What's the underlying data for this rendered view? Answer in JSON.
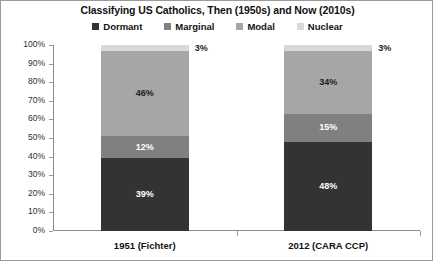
{
  "chart_data": {
    "type": "bar",
    "subtype": "stacked-column-100",
    "title": "Classifying US Catholics, Then (1950s) and Now (2010s)",
    "xlabel": "",
    "ylabel": "",
    "ylim": [
      0,
      100
    ],
    "ytick_labels": [
      "0%",
      "10%",
      "20%",
      "30%",
      "40%",
      "50%",
      "60%",
      "70%",
      "80%",
      "90%",
      "100%"
    ],
    "ytick_values": [
      0,
      10,
      20,
      30,
      40,
      50,
      60,
      70,
      80,
      90,
      100
    ],
    "grid": false,
    "legend_position": "top",
    "categories": [
      "1951 (Fichter)",
      "2012 (CARA CCP)"
    ],
    "series": [
      {
        "name": "Dormant",
        "color": "#333333",
        "label_color": "light",
        "values": [
          39,
          48
        ],
        "labels": [
          "39%",
          "48%"
        ]
      },
      {
        "name": "Marginal",
        "color": "#808080",
        "label_color": "light",
        "values": [
          12,
          15
        ],
        "labels": [
          "12%",
          "15%"
        ]
      },
      {
        "name": "Modal",
        "color": "#a6a6a6",
        "label_color": "dark",
        "values": [
          46,
          34
        ],
        "labels": [
          "46%",
          "34%"
        ]
      },
      {
        "name": "Nuclear",
        "color": "#d9d9d9",
        "label_color": "dark",
        "label_placement": "outside",
        "values": [
          3,
          3
        ],
        "labels": [
          "3%",
          "3%"
        ]
      }
    ]
  }
}
